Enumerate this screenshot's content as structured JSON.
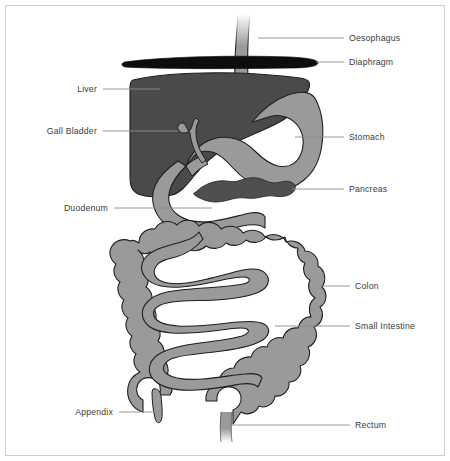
{
  "figure": {
    "background_color": "#ffffff",
    "frame_color": "#cfcfcf",
    "label_text_color": "#3b3b3b",
    "leader_line_color": "#8c8c8c"
  },
  "palette": {
    "liver_dark_gray": "#4a4a4a",
    "pancreas_dark_gray": "#4f4f4f",
    "organ_mid_gray": "#9a9a9a",
    "colon_gray": "#9a9a9a",
    "diaphragm_black": "#0d0d0d",
    "outline_black": "#1e1e1e",
    "white": "#ffffff"
  },
  "labels": [
    {
      "id": "oesophagus",
      "text": "Oesophagus",
      "side": "right",
      "text_x": 349,
      "text_y": 41,
      "leader": "M 258 38 L 344 38"
    },
    {
      "id": "diaphragm",
      "text": "Diaphragm",
      "side": "right",
      "text_x": 349,
      "text_y": 65,
      "leader": "M 316 62 L 344 62"
    },
    {
      "id": "liver",
      "text": "Liver",
      "side": "left",
      "text_x": 97,
      "text_y": 92,
      "text_anchor": "end",
      "leader": "M 103 89 L 160 89"
    },
    {
      "id": "gall-bladder",
      "text": "Gall Bladder",
      "side": "left",
      "text_x": 97,
      "text_y": 134,
      "text_anchor": "end",
      "leader": "M 103 131 L 178 131"
    },
    {
      "id": "stomach",
      "text": "Stomach",
      "side": "right",
      "text_x": 349,
      "text_y": 140,
      "leader": "M 295 137 L 344 137"
    },
    {
      "id": "pancreas",
      "text": "Pancreas",
      "side": "right",
      "text_x": 349,
      "text_y": 192,
      "leader": "M 292 189 L 344 189"
    },
    {
      "id": "duodenum",
      "text": "Duodenum",
      "side": "left",
      "text_x": 108,
      "text_y": 211,
      "text_anchor": "end",
      "leader": "M 114 208 L 212 208"
    },
    {
      "id": "colon",
      "text": "Colon",
      "side": "right",
      "text_x": 355,
      "text_y": 289,
      "leader": "M 318 286 L 350 286"
    },
    {
      "id": "small-intestine",
      "text": "Small Intestine",
      "side": "right",
      "text_x": 355,
      "text_y": 329,
      "leader": "M 275 326 L 350 326"
    },
    {
      "id": "appendix",
      "text": "Appendix",
      "side": "left",
      "text_x": 113,
      "text_y": 415,
      "text_anchor": "end",
      "leader": "M 119 412 L 157 412"
    },
    {
      "id": "rectum",
      "text": "Rectum",
      "side": "right",
      "text_x": 355,
      "text_y": 428,
      "leader": "M 232 425 L 350 425"
    }
  ],
  "organs": [
    {
      "id": "oesophagus",
      "name": "Oesophagus",
      "fill": "#9a9a9a"
    },
    {
      "id": "diaphragm",
      "name": "Diaphragm",
      "fill": "#0d0d0d"
    },
    {
      "id": "liver",
      "name": "Liver",
      "fill": "#4a4a4a"
    },
    {
      "id": "gall-bladder",
      "name": "Gall Bladder",
      "fill": "#9a9a9a"
    },
    {
      "id": "stomach",
      "name": "Stomach",
      "fill": "#9a9a9a"
    },
    {
      "id": "pancreas",
      "name": "Pancreas",
      "fill": "#4f4f4f"
    },
    {
      "id": "duodenum",
      "name": "Duodenum",
      "fill": "#9a9a9a"
    },
    {
      "id": "colon",
      "name": "Colon",
      "fill": "#9a9a9a"
    },
    {
      "id": "small-intestine",
      "name": "Small Intestine",
      "fill": "#9a9a9a"
    },
    {
      "id": "appendix",
      "name": "Appendix",
      "fill": "#9a9a9a"
    },
    {
      "id": "rectum",
      "name": "Rectum",
      "fill": "#9a9a9a"
    }
  ]
}
